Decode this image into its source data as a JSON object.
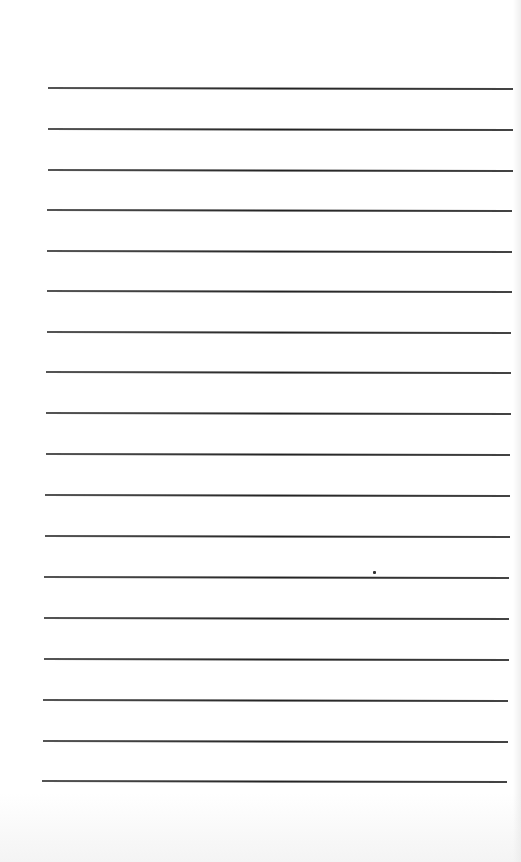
{
  "document": {
    "type": "lined-paper",
    "line_count": 18,
    "line_color": "#2a2a2a",
    "background_color": "#ffffff",
    "lines": [
      {
        "y": 87,
        "x1": 48,
        "x2": 513
      },
      {
        "y": 128,
        "x1": 48,
        "x2": 513
      },
      {
        "y": 169,
        "x1": 48,
        "x2": 513
      },
      {
        "y": 209,
        "x1": 47,
        "x2": 512
      },
      {
        "y": 250,
        "x1": 47,
        "x2": 512
      },
      {
        "y": 290,
        "x1": 47,
        "x2": 512
      },
      {
        "y": 331,
        "x1": 47,
        "x2": 511
      },
      {
        "y": 371,
        "x1": 46,
        "x2": 511
      },
      {
        "y": 412,
        "x1": 46,
        "x2": 511
      },
      {
        "y": 453,
        "x1": 46,
        "x2": 510
      },
      {
        "y": 494,
        "x1": 45,
        "x2": 510
      },
      {
        "y": 535,
        "x1": 45,
        "x2": 510
      },
      {
        "y": 576,
        "x1": 44,
        "x2": 509
      },
      {
        "y": 617,
        "x1": 44,
        "x2": 509
      },
      {
        "y": 658,
        "x1": 44,
        "x2": 509
      },
      {
        "y": 699,
        "x1": 43,
        "x2": 508
      },
      {
        "y": 740,
        "x1": 43,
        "x2": 508
      },
      {
        "y": 780,
        "x1": 42,
        "x2": 507
      }
    ],
    "marks": [
      {
        "type": "dot",
        "x": 373,
        "y": 571
      }
    ]
  }
}
